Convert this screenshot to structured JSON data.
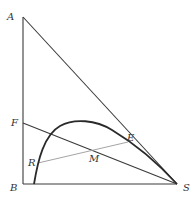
{
  "diagram": {
    "type": "geometry",
    "points": {
      "A": {
        "label": "A",
        "x": 23,
        "y": 17
      },
      "F": {
        "label": "F",
        "x": 23,
        "y": 123
      },
      "B": {
        "label": "B",
        "x": 23,
        "y": 184
      },
      "S": {
        "label": "S",
        "x": 177,
        "y": 184
      },
      "R": {
        "label": "R",
        "x": 38,
        "y": 163
      },
      "M": {
        "label": "M",
        "x": 93,
        "y": 152
      },
      "E": {
        "label": "E",
        "x": 128,
        "y": 142
      }
    },
    "segments": [
      "AB",
      "BS",
      "AS",
      "FS",
      "RE"
    ],
    "curve": "arc from near B through R, peak, E to S",
    "colors": {
      "line": "#3a3a3a",
      "thin_line": "#9a9a9a",
      "curve": "#2a2a2a",
      "label": "#333333"
    }
  }
}
